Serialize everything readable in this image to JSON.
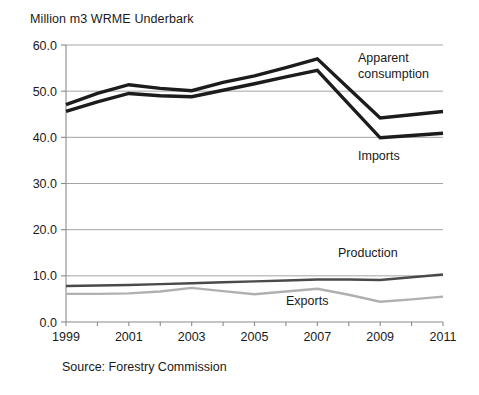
{
  "chart_data": {
    "type": "line",
    "title": "Million m3 WRME  Underbark",
    "xlabel": "",
    "ylabel": "",
    "ylim": [
      0.0,
      60.0
    ],
    "xlim": [
      1999,
      2011
    ],
    "grid": true,
    "legend_position": "inline-labels",
    "source": "Source: Forestry Commission",
    "x": [
      1999,
      2000,
      2001,
      2002,
      2003,
      2004,
      2005,
      2006,
      2007,
      2008,
      2009,
      2010,
      2011
    ],
    "tick_labels_x": [
      "1999",
      "2001",
      "2003",
      "2005",
      "2007",
      "2009",
      "2011"
    ],
    "tick_values_x": [
      1999,
      2001,
      2003,
      2005,
      2007,
      2009,
      2011
    ],
    "tick_labels_y": [
      "0.0",
      "10.0",
      "20.0",
      "30.0",
      "40.0",
      "50.0",
      "60.0"
    ],
    "tick_values_y": [
      0.0,
      10.0,
      20.0,
      30.0,
      40.0,
      50.0,
      60.0
    ],
    "series": [
      {
        "name": "Apparent consumption",
        "color": "#1c1c1c",
        "width": 3.4,
        "values": [
          47.1,
          49.5,
          51.4,
          50.6,
          50.1,
          51.9,
          53.3,
          55.1,
          57.0,
          50.6,
          44.2,
          44.9,
          45.6
        ]
      },
      {
        "name": "Imports",
        "color": "#1c1c1c",
        "width": 3.4,
        "values": [
          45.6,
          47.7,
          49.5,
          49.0,
          48.8,
          50.2,
          51.6,
          53.1,
          54.5,
          47.2,
          39.9,
          40.4,
          40.9
        ]
      },
      {
        "name": "Production",
        "color": "#4a4a4a",
        "width": 2.4,
        "values": [
          7.8,
          7.9,
          8.0,
          8.2,
          8.4,
          8.6,
          8.8,
          9.0,
          9.2,
          9.2,
          9.1,
          9.7,
          10.3
        ]
      },
      {
        "name": "Exports",
        "color": "#b0b0b0",
        "width": 2.4,
        "values": [
          6.1,
          6.1,
          6.2,
          6.6,
          7.4,
          6.7,
          6.0,
          6.6,
          7.2,
          5.9,
          4.4,
          4.9,
          5.5
        ]
      }
    ],
    "annotations": [
      {
        "text_line1": "Apparent",
        "text_line2": "consumption",
        "x": 358,
        "y": 62
      },
      {
        "text_line1": "Imports",
        "text_line2": "",
        "x": 358,
        "y": 160
      },
      {
        "text_line1": "Production",
        "text_line2": "",
        "x": 338,
        "y": 257
      },
      {
        "text_line1": "Exports",
        "text_line2": "",
        "x": 286,
        "y": 305
      }
    ]
  }
}
